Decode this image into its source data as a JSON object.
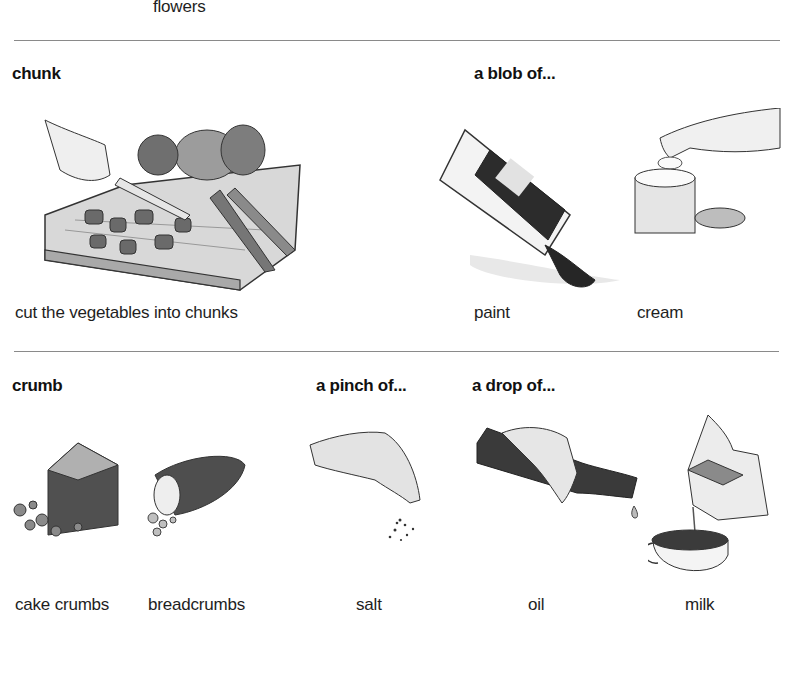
{
  "top_caption": "flowers",
  "sections": [
    {
      "heading": "chunk",
      "captions": [
        "cut the vegetables into chunks"
      ]
    },
    {
      "heading": "a blob of...",
      "captions": [
        "paint",
        "cream"
      ]
    },
    {
      "heading": "crumb",
      "captions": [
        "cake crumbs",
        "breadcrumbs"
      ]
    },
    {
      "heading": "a pinch of...",
      "captions": [
        "salt"
      ]
    },
    {
      "heading": "a drop of...",
      "captions": [
        "oil",
        "milk"
      ]
    }
  ],
  "illustrations": [
    {
      "name": "hand cutting vegetables on a chopping board"
    },
    {
      "name": "tube of paint squeezed"
    },
    {
      "name": "finger taking cream from a jar"
    },
    {
      "name": "slice of cake with crumbs"
    },
    {
      "name": "bread loaf with crumbs"
    },
    {
      "name": "hand sprinkling salt"
    },
    {
      "name": "hand pouring oil from a bottle"
    },
    {
      "name": "milk poured from carton into cup"
    }
  ]
}
